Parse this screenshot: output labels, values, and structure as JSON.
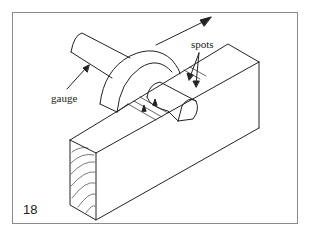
{
  "diagram": {
    "figure_number": "18",
    "labels": {
      "gauge": "gauge",
      "spots": "spots"
    },
    "colors": {
      "line": "#222222",
      "frame": "#8a8a8a",
      "background": "#ffffff"
    }
  }
}
